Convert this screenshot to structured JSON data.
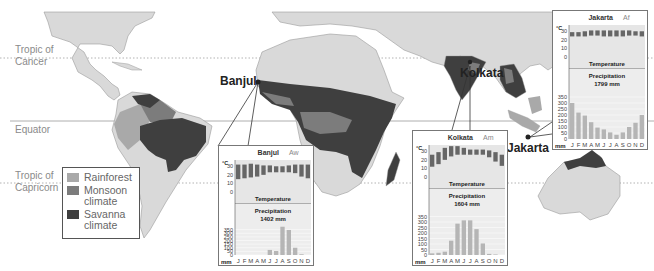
{
  "map": {
    "latitude_lines": [
      {
        "label_line1": "Tropic of",
        "label_line2": "Cancer",
        "y": 58
      },
      {
        "label_line1": "Equator",
        "label_line2": "",
        "y": 121
      },
      {
        "label_line1": "Tropic of",
        "label_line2": "Capricorn",
        "y": 183
      }
    ],
    "legend": {
      "items": [
        {
          "label": "Rainforest",
          "color": "#a9a9a9"
        },
        {
          "label": "Monsoon climate",
          "color": "#7c7c7c"
        },
        {
          "label": "Savanna climate",
          "color": "#3f3f3f"
        }
      ]
    },
    "cities": [
      {
        "name": "Banjul"
      },
      {
        "name": "Kolkata"
      },
      {
        "name": "Jakarta"
      }
    ],
    "colors": {
      "land": "#d9d9d9",
      "border": "#9a9a9a",
      "savanna": "#3f3f3f",
      "monsoon": "#7c7c7c",
      "rainforest": "#a9a9a9"
    }
  },
  "chart_data": [
    {
      "type": "bar",
      "title": "Banjul",
      "climate_code": "Aw",
      "temperature_label": "Temperature",
      "temperature_unit": "°C",
      "temperature_ticks": [
        0,
        10,
        20,
        30
      ],
      "precipitation_label": "Precipitation",
      "precipitation_total": "1402 mm",
      "precipitation_unit": "mm",
      "precipitation_ticks": [
        0,
        50,
        100,
        150,
        200,
        250,
        300,
        350
      ],
      "categories": [
        "J",
        "F",
        "M",
        "A",
        "M",
        "J",
        "J",
        "A",
        "S",
        "O",
        "N",
        "D"
      ],
      "series": [
        {
          "name": "Temperature max",
          "values": [
            32,
            32,
            33,
            32,
            31,
            31,
            30,
            30,
            31,
            32,
            32,
            32
          ]
        },
        {
          "name": "Temperature min",
          "values": [
            15,
            16,
            17,
            18,
            20,
            23,
            23,
            23,
            23,
            22,
            18,
            16
          ]
        },
        {
          "name": "Precipitation",
          "values": [
            0,
            0,
            0,
            0,
            0,
            70,
            55,
            390,
            345,
            100,
            10,
            0
          ]
        }
      ],
      "ylim": [
        0,
        400
      ]
    },
    {
      "type": "bar",
      "title": "Kolkata",
      "climate_code": "Am",
      "temperature_label": "Temperature",
      "temperature_unit": "°C",
      "temperature_ticks": [
        0,
        10,
        20,
        30
      ],
      "precipitation_label": "Precipitation",
      "precipitation_total": "1604 mm",
      "precipitation_unit": "mm",
      "precipitation_ticks": [
        0,
        50,
        100,
        150,
        200,
        250,
        300,
        350
      ],
      "categories": [
        "J",
        "F",
        "M",
        "A",
        "M",
        "J",
        "J",
        "A",
        "S",
        "O",
        "N",
        "D"
      ],
      "series": [
        {
          "name": "Temperature max",
          "values": [
            26,
            29,
            34,
            36,
            36,
            34,
            32,
            32,
            32,
            31,
            29,
            26
          ]
        },
        {
          "name": "Temperature min",
          "values": [
            12,
            15,
            20,
            24,
            26,
            26,
            26,
            26,
            26,
            23,
            18,
            13
          ]
        },
        {
          "name": "Precipitation",
          "values": [
            15,
            20,
            30,
            130,
            285,
            315,
            315,
            235,
            105,
            10,
            5,
            0
          ]
        }
      ],
      "ylim": [
        0,
        400
      ]
    },
    {
      "type": "bar",
      "title": "Jakarta",
      "climate_code": "Af",
      "temperature_label": "Temperature",
      "temperature_unit": "°C",
      "temperature_ticks": [
        0,
        10,
        20,
        30
      ],
      "precipitation_label": "Precipitation",
      "precipitation_total": "1799 mm",
      "precipitation_unit": "mm",
      "precipitation_ticks": [
        0,
        50,
        100,
        150,
        200,
        250,
        300,
        350
      ],
      "categories": [
        "J",
        "F",
        "M",
        "A",
        "M",
        "J",
        "J",
        "A",
        "S",
        "O",
        "N",
        "D"
      ],
      "series": [
        {
          "name": "Temperature max",
          "values": [
            29,
            29,
            30,
            31,
            31,
            31,
            31,
            31,
            31,
            31,
            30,
            30
          ]
        },
        {
          "name": "Temperature min",
          "values": [
            24,
            24,
            24,
            25,
            25,
            24,
            24,
            24,
            24,
            25,
            25,
            24
          ]
        },
        {
          "name": "Precipitation",
          "values": [
            300,
            220,
            195,
            140,
            95,
            80,
            55,
            35,
            55,
            100,
            135,
            200
          ]
        }
      ],
      "ylim": [
        0,
        400
      ]
    }
  ]
}
